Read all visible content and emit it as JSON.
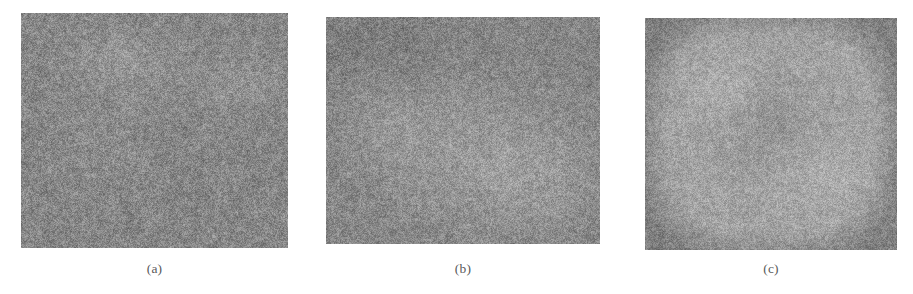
{
  "figure": {
    "background_color": "#ffffff",
    "width": 913,
    "height": 294,
    "caption_color": "#5a5a5a",
    "panels": [
      {
        "id": "a",
        "caption": "(a)",
        "kind": "grayscale-noise-image",
        "description": "Speckled gray noise field with a faint brighter rounded patch in the upper-left quadrant and a subtle lighter textured band at mid-right.",
        "base_gray": "#878787",
        "noise_amplitude": 46,
        "rect": {
          "x": 21,
          "y": 13,
          "width": 267,
          "height": 235
        },
        "features": [
          {
            "type": "blob",
            "cx": 0.36,
            "cy": 0.2,
            "rx": 0.2,
            "ry": 0.17,
            "brightness": 16,
            "softness": 0.55
          },
          {
            "type": "blob",
            "cx": 0.8,
            "cy": 0.3,
            "rx": 0.22,
            "ry": 0.12,
            "brightness": 11,
            "softness": 0.7
          },
          {
            "type": "blob",
            "cx": 0.3,
            "cy": 0.52,
            "rx": 0.16,
            "ry": 0.13,
            "brightness": 6,
            "softness": 0.8
          }
        ]
      },
      {
        "id": "b",
        "caption": "(b)",
        "kind": "grayscale-noise-image",
        "description": "Speckled gray noise field with a broad brighter granular region through the center and lower-right, slightly darker at the upper-left corner.",
        "base_gray": "#858585",
        "noise_amplitude": 44,
        "rect": {
          "x": 326,
          "y": 17,
          "width": 274,
          "height": 227
        },
        "features": [
          {
            "type": "blob",
            "cx": 0.52,
            "cy": 0.6,
            "rx": 0.4,
            "ry": 0.36,
            "brightness": 18,
            "softness": 0.62
          },
          {
            "type": "blob",
            "cx": 0.78,
            "cy": 0.72,
            "rx": 0.24,
            "ry": 0.24,
            "brightness": 14,
            "softness": 0.7
          },
          {
            "type": "blob",
            "cx": 0.22,
            "cy": 0.46,
            "rx": 0.18,
            "ry": 0.22,
            "brightness": 9,
            "softness": 0.75
          },
          {
            "type": "blob",
            "cx": 0.18,
            "cy": 0.12,
            "rx": 0.22,
            "ry": 0.16,
            "brightness": -10,
            "softness": 0.8
          }
        ]
      },
      {
        "id": "c",
        "caption": "(c)",
        "kind": "grayscale-noise-image",
        "description": "Speckled gray noise field dominated by a large bright rounded-square blob filling the central area, with a darker smooth core near the middle and a uniform gray border frame.",
        "base_gray": "#7f7f7f",
        "noise_amplitude": 40,
        "rect": {
          "x": 645,
          "y": 18,
          "width": 252,
          "height": 232
        },
        "features": [
          {
            "type": "ring",
            "cx": 0.5,
            "cy": 0.5,
            "rx": 0.41,
            "ry": 0.43,
            "brightness": 40,
            "softness": 0.3
          },
          {
            "type": "blob",
            "cx": 0.5,
            "cy": 0.44,
            "rx": 0.16,
            "ry": 0.18,
            "brightness": -14,
            "softness": 0.85
          },
          {
            "type": "blob",
            "cx": 0.33,
            "cy": 0.3,
            "rx": 0.14,
            "ry": 0.13,
            "brightness": 12,
            "softness": 0.7
          },
          {
            "type": "blob",
            "cx": 0.7,
            "cy": 0.66,
            "rx": 0.15,
            "ry": 0.14,
            "brightness": 10,
            "softness": 0.7
          }
        ]
      }
    ]
  }
}
